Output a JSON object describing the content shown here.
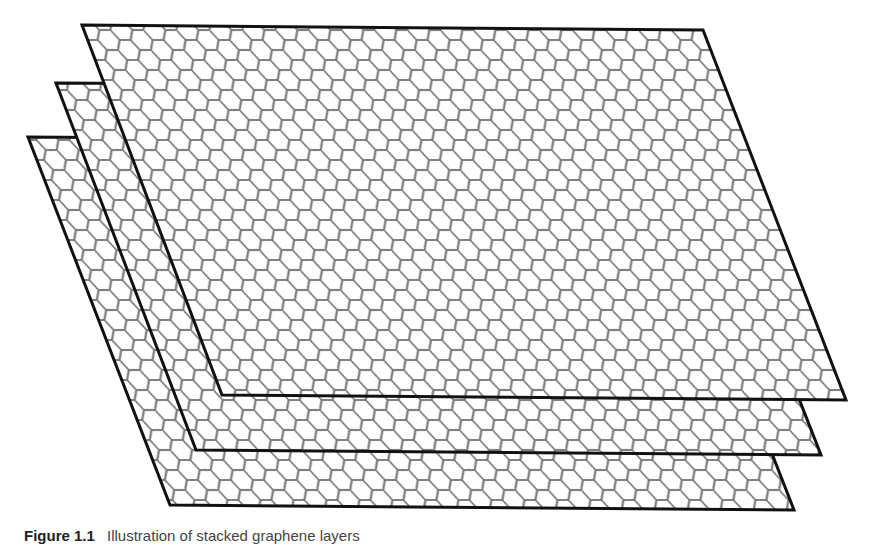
{
  "figure": {
    "layer_count": 3,
    "colors": {
      "border": "#111111",
      "lattice": "#7a7a7a",
      "fill": "#ffffff",
      "background": "#ffffff"
    },
    "layers": [
      {
        "name": "bottom-layer",
        "points": "28,137 650,142 794,510 170,505"
      },
      {
        "name": "middle-layer",
        "points": "56,83 677,87 821,455 196,450"
      },
      {
        "name": "top-layer",
        "points": "82,25 703,30 846,400 222,395"
      }
    ]
  },
  "caption": {
    "label": "Figure 1.1",
    "text": "Illustration of stacked graphene layers"
  }
}
